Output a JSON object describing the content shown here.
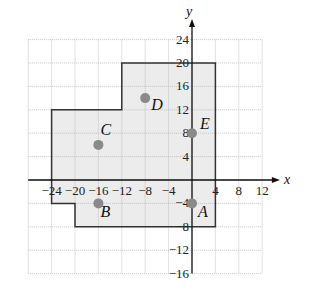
{
  "diagram": {
    "axes": {
      "x_label": "x",
      "y_label": "y"
    },
    "x_ticks": [
      "-24",
      "-20",
      "-16",
      "-12",
      "-8",
      "-4",
      "4",
      "8",
      "12"
    ],
    "y_ticks": [
      "24",
      "20",
      "16",
      "12",
      "8",
      "4",
      "-4",
      "-8",
      "-12",
      "-16"
    ],
    "points": [
      {
        "label": "A",
        "x": 0,
        "y": -4
      },
      {
        "label": "B",
        "x": -16,
        "y": -4
      },
      {
        "label": "C",
        "x": -16,
        "y": 6
      },
      {
        "label": "D",
        "x": -8,
        "y": 14
      },
      {
        "label": "E",
        "x": 0,
        "y": 8
      }
    ],
    "region_vertices": [
      [
        4,
        20
      ],
      [
        4,
        -8
      ],
      [
        -20,
        -8
      ],
      [
        -20,
        -4
      ],
      [
        -24,
        -4
      ],
      [
        -24,
        12
      ],
      [
        -12,
        12
      ],
      [
        -12,
        20
      ]
    ],
    "colors": {
      "fill": "#ececec",
      "point": "#8a8a8a",
      "grid": "#b8b8b8",
      "outline": "#333333"
    }
  }
}
